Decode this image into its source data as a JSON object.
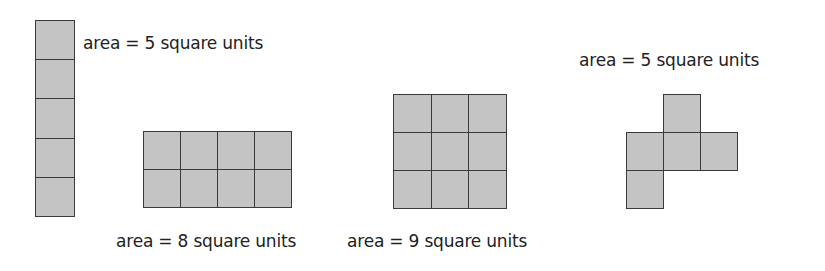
{
  "figures": [
    {
      "id": "column",
      "rows": 5,
      "cols": 1,
      "cells": [
        [
          0,
          0
        ],
        [
          1,
          0
        ],
        [
          2,
          0
        ],
        [
          3,
          0
        ],
        [
          4,
          0
        ]
      ],
      "label": "area = 5 square units",
      "area": 5
    },
    {
      "id": "rect-2x4",
      "rows": 2,
      "cols": 4,
      "cells": [
        [
          0,
          0
        ],
        [
          0,
          1
        ],
        [
          0,
          2
        ],
        [
          0,
          3
        ],
        [
          1,
          0
        ],
        [
          1,
          1
        ],
        [
          1,
          2
        ],
        [
          1,
          3
        ]
      ],
      "label": "area = 8 square units",
      "area": 8
    },
    {
      "id": "square-3x3",
      "rows": 3,
      "cols": 3,
      "cells": [
        [
          0,
          0
        ],
        [
          0,
          1
        ],
        [
          0,
          2
        ],
        [
          1,
          0
        ],
        [
          1,
          1
        ],
        [
          1,
          2
        ],
        [
          2,
          0
        ],
        [
          2,
          1
        ],
        [
          2,
          2
        ]
      ],
      "label": "area = 9 square units",
      "area": 9
    },
    {
      "id": "pentomino",
      "rows": 3,
      "cols": 3,
      "cells": [
        [
          0,
          1
        ],
        [
          1,
          0
        ],
        [
          1,
          1
        ],
        [
          1,
          2
        ],
        [
          2,
          0
        ]
      ],
      "label": "area = 5 square units",
      "area": 5
    }
  ],
  "colors": {
    "cell_fill": "#c4c4c4",
    "cell_border": "#3a3a3a",
    "text": "#222222"
  }
}
